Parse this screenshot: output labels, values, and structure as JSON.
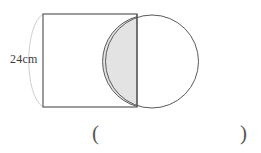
{
  "figure": {
    "type": "geometry-diagram",
    "background_color": "#ffffff",
    "dimension_label": "24cm",
    "dimension_value": 24,
    "dimension_unit": "cm",
    "dimension_applies_to": "square-side",
    "square": {
      "name": "square",
      "x": 43,
      "y": 14,
      "width": 94,
      "height": 93,
      "stroke_color": "#555555",
      "fill": "none"
    },
    "circle": {
      "name": "circle",
      "cx": 152,
      "cy": 61.5,
      "r": 46.5,
      "stroke_color": "#555555",
      "fill": "none"
    },
    "overlap_region": {
      "name": "shaded-overlap",
      "fill_color": "#e3e3e3",
      "stroke_color": "#555555"
    },
    "guide_arc": {
      "name": "guide-arc",
      "stroke_color": "#cfcfcf",
      "description": "faint arc mirrored to the left of the square"
    }
  },
  "answer_field": {
    "open_paren": "(",
    "close_paren": ")"
  }
}
